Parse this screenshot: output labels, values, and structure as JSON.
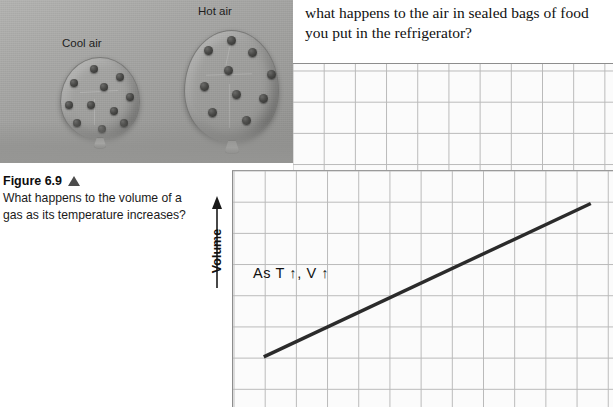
{
  "question": {
    "text": "what happens to the air in sealed bags of food you put in the refrigerator?"
  },
  "photo": {
    "label_cool": "Cool air",
    "label_hot": "Hot air"
  },
  "caption": {
    "figure_number": "Figure 6.9",
    "marker_icon": "up-triangle-icon",
    "text": "What happens to the volume of a gas as its temperature increases?"
  },
  "graph": {
    "y_axis_label": "Volume",
    "y_axis_arrow_icon": "arrow-up-icon",
    "annotation": "As T ↑, V ↑",
    "grid_color": "#b9b9b9",
    "line_color": "#2b2b2b"
  },
  "chart_data": {
    "type": "line",
    "title": "",
    "xlabel": "",
    "ylabel": "Volume",
    "grid": true,
    "legend": null,
    "annotations": [
      "As T ↑, V ↑"
    ],
    "xlim": [
      0,
      12
    ],
    "ylim": [
      0,
      8
    ],
    "series": [
      {
        "name": "Volume vs Temperature",
        "x": [
          1,
          11.3
        ],
        "values": [
          1.7,
          6.9
        ]
      }
    ]
  }
}
